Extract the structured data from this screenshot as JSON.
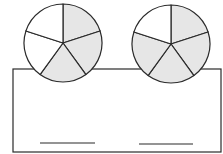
{
  "diagram": {
    "colors": {
      "stroke": "#2a2a2a",
      "shaded": "#e6e6e6",
      "unshaded": "#ffffff"
    },
    "circles": [
      {
        "name": "left-fraction-circle",
        "cx": 63,
        "cy": 43,
        "r": 39,
        "parts": 5,
        "shaded": [
          0,
          1,
          2
        ]
      },
      {
        "name": "right-fraction-circle",
        "cx": 171,
        "cy": 44,
        "r": 39,
        "parts": 5,
        "shaded": [
          0,
          1,
          2,
          3
        ]
      }
    ],
    "box": {
      "x": 13,
      "y": 69,
      "width": 208,
      "height": 83
    },
    "answer_lines": [
      {
        "name": "left-answer-line",
        "x1": 40,
        "x2": 95,
        "y": 143
      },
      {
        "name": "right-answer-line",
        "x1": 139,
        "x2": 193,
        "y": 144
      }
    ],
    "fractions_shaded": [
      "3/5",
      "4/5"
    ]
  }
}
